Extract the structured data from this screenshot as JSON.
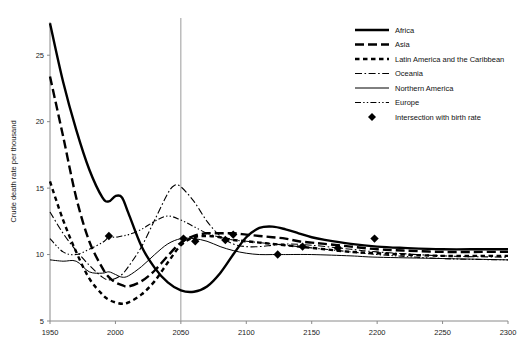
{
  "chart_data": {
    "type": "line",
    "title": "",
    "xlabel": "",
    "ylabel": "Crude death rate per thousand",
    "xlim": [
      1950,
      2300
    ],
    "ylim": [
      5,
      27.5
    ],
    "xticks": [
      1950,
      2000,
      2050,
      2100,
      2150,
      2200,
      2250,
      2300
    ],
    "yticks": [
      5,
      10,
      15,
      20,
      25
    ],
    "grid": false,
    "legend_position": "top-right",
    "reference_line_x": 2050,
    "series": [
      {
        "name": "Africa",
        "style": "thick-solid",
        "x": [
          1950,
          1960,
          1970,
          1980,
          1990,
          1995,
          2000,
          2005,
          2010,
          2020,
          2030,
          2040,
          2050,
          2060,
          2070,
          2080,
          2090,
          2100,
          2110,
          2120,
          2130,
          2140,
          2150,
          2160,
          2180,
          2200,
          2220,
          2250,
          2280,
          2300
        ],
        "values": [
          27.4,
          23.0,
          19.4,
          16.4,
          14.3,
          14.0,
          14.4,
          14.3,
          13.1,
          10.6,
          9.0,
          7.9,
          7.3,
          7.2,
          7.6,
          8.6,
          10.0,
          11.3,
          12.0,
          12.1,
          11.9,
          11.6,
          11.3,
          11.1,
          10.8,
          10.6,
          10.5,
          10.4,
          10.4,
          10.4
        ]
      },
      {
        "name": "Asia",
        "style": "thick-long-dash",
        "x": [
          1950,
          1960,
          1970,
          1980,
          1990,
          1995,
          2000,
          2005,
          2010,
          2020,
          2030,
          2040,
          2050,
          2060,
          2070,
          2080,
          2090,
          2100,
          2110,
          2120,
          2130,
          2140,
          2150,
          2160,
          2180,
          2200,
          2220,
          2250,
          2280,
          2300
        ],
        "values": [
          23.4,
          18.9,
          14.3,
          11.0,
          9.0,
          8.3,
          7.9,
          7.7,
          7.6,
          8.0,
          8.8,
          9.9,
          10.9,
          11.4,
          11.6,
          11.6,
          11.6,
          11.5,
          11.4,
          11.3,
          11.2,
          11.0,
          10.9,
          10.8,
          10.6,
          10.4,
          10.3,
          10.2,
          10.2,
          10.2
        ]
      },
      {
        "name": "Latin America and the Caribbean",
        "style": "thick-short-dash",
        "x": [
          1950,
          1960,
          1970,
          1980,
          1990,
          1995,
          2000,
          2005,
          2010,
          2020,
          2030,
          2040,
          2050,
          2060,
          2070,
          2080,
          2090,
          2100,
          2110,
          2120,
          2130,
          2140,
          2150,
          2160,
          2180,
          2200,
          2220,
          2250,
          2280,
          2300
        ],
        "values": [
          15.5,
          12.6,
          10.2,
          8.2,
          7.0,
          6.6,
          6.4,
          6.3,
          6.4,
          7.0,
          8.0,
          9.4,
          10.7,
          11.3,
          11.4,
          11.3,
          11.1,
          11.0,
          10.9,
          10.8,
          10.7,
          10.6,
          10.5,
          10.4,
          10.2,
          10.1,
          10.0,
          9.9,
          9.9,
          9.9
        ]
      },
      {
        "name": "Oceania",
        "style": "thin-dash-dot",
        "x": [
          1950,
          1960,
          1970,
          1980,
          1990,
          1995,
          2000,
          2005,
          2010,
          2020,
          2030,
          2040,
          2045,
          2050,
          2060,
          2070,
          2080,
          2090,
          2100,
          2110,
          2120,
          2130,
          2150,
          2180,
          2200,
          2250,
          2300
        ],
        "values": [
          13.2,
          11.6,
          10.3,
          9.2,
          8.3,
          8.1,
          8.2,
          8.5,
          9.1,
          10.6,
          12.6,
          14.6,
          15.2,
          15.1,
          14.0,
          12.5,
          11.4,
          10.8,
          10.6,
          10.6,
          10.7,
          10.8,
          10.7,
          10.4,
          10.2,
          9.9,
          9.8
        ]
      },
      {
        "name": "Northern America",
        "style": "thin-solid",
        "x": [
          1950,
          1960,
          1970,
          1980,
          1990,
          1995,
          2000,
          2005,
          2010,
          2020,
          2030,
          2040,
          2050,
          2060,
          2070,
          2080,
          2090,
          2100,
          2110,
          2120,
          2130,
          2150,
          2180,
          2200,
          2250,
          2300
        ],
        "values": [
          9.6,
          9.5,
          9.5,
          8.7,
          8.6,
          8.7,
          8.5,
          8.3,
          8.4,
          9.1,
          10.0,
          10.8,
          11.2,
          11.2,
          11.0,
          10.6,
          10.3,
          10.1,
          10.0,
          10.0,
          10.0,
          10.0,
          9.9,
          9.8,
          9.7,
          9.6
        ]
      },
      {
        "name": "Europe",
        "style": "thin-dash-dot-dot",
        "x": [
          1950,
          1960,
          1970,
          1980,
          1990,
          1995,
          2000,
          2005,
          2010,
          2020,
          2030,
          2040,
          2050,
          2060,
          2070,
          2080,
          2090,
          2100,
          2110,
          2120,
          2130,
          2150,
          2180,
          2200,
          2250,
          2300
        ],
        "values": [
          11.2,
          10.2,
          10.0,
          10.4,
          10.9,
          11.3,
          11.3,
          11.4,
          11.5,
          11.9,
          12.5,
          12.9,
          12.6,
          12.1,
          11.6,
          11.3,
          11.1,
          11.0,
          10.9,
          10.8,
          10.7,
          10.5,
          10.2,
          10.0,
          9.7,
          9.6
        ]
      }
    ],
    "intersection_markers": {
      "label": "Intersection with birth rate",
      "points": [
        {
          "series": "Europe",
          "x": 1995,
          "y": 11.4
        },
        {
          "series": "Northern America",
          "x": 2052,
          "y": 11.2
        },
        {
          "series": "Latin America and the Caribbean",
          "x": 2061,
          "y": 11.0
        },
        {
          "series": "Oceania",
          "x": 2084,
          "y": 11.1
        },
        {
          "series": "Asia",
          "x": 2090,
          "y": 11.5
        },
        {
          "series": "Northern America",
          "x": 2124,
          "y": 10.0
        },
        {
          "series": "Europe",
          "x": 2143,
          "y": 10.6
        },
        {
          "series": "Latin America and the Caribbean",
          "x": 2170,
          "y": 10.5
        },
        {
          "series": "Africa",
          "x": 2198,
          "y": 11.2
        }
      ]
    }
  },
  "legend": {
    "entries": [
      {
        "label": "Africa",
        "style": "thick-solid"
      },
      {
        "label": "Asia",
        "style": "thick-long-dash"
      },
      {
        "label": "Latin America and the Caribbean",
        "style": "thick-short-dash"
      },
      {
        "label": "Oceania",
        "style": "thin-dash-dot"
      },
      {
        "label": "Northern America",
        "style": "thin-solid"
      },
      {
        "label": "Europe",
        "style": "thin-dash-dot-dot"
      },
      {
        "label": "Intersection with birth rate",
        "style": "diamond-marker"
      }
    ]
  },
  "axes": {
    "y_title": "Crude death rate per thousand",
    "x_tick_labels": [
      "1950",
      "2000",
      "2050",
      "2100",
      "2150",
      "2200",
      "2250",
      "2300"
    ],
    "y_tick_labels": [
      "5",
      "10",
      "15",
      "20",
      "25"
    ]
  },
  "colors": {
    "ink": "#000000",
    "axis": "#8a8a8a",
    "background": "#ffffff"
  }
}
